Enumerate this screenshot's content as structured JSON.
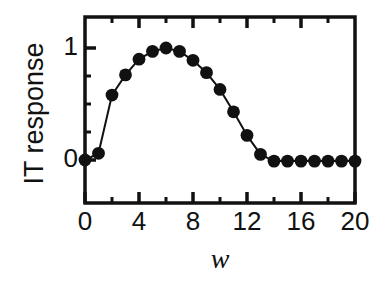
{
  "chart_data": {
    "type": "line",
    "title": "",
    "xlabel": "w",
    "ylabel": "IT response",
    "xlim": [
      0,
      20
    ],
    "ylim": [
      -0.12,
      1.18
    ],
    "grid": false,
    "legend": null,
    "marker": "filled-circle",
    "marker_color": "#111111",
    "line_color": "#111111",
    "x_major_ticks": [
      0,
      4,
      8,
      12,
      16,
      20
    ],
    "x_minor_ticks": [
      2,
      6,
      10,
      14,
      18
    ],
    "x_tick_labels": [
      "0",
      "4",
      "8",
      "12",
      "16",
      "20"
    ],
    "y_major_ticks": [
      0,
      1
    ],
    "y_minor_ticks": [
      0.25,
      0.5,
      0.75
    ],
    "y_tick_labels": [
      "0",
      "1"
    ],
    "x": [
      0,
      1,
      2,
      3,
      4,
      5,
      6,
      7,
      8,
      9,
      10,
      11,
      12,
      13,
      14,
      15,
      16,
      17,
      18,
      19,
      20
    ],
    "values": [
      0.0,
      0.06,
      0.58,
      0.76,
      0.9,
      0.97,
      1.0,
      0.97,
      0.89,
      0.78,
      0.63,
      0.43,
      0.22,
      0.05,
      -0.01,
      -0.01,
      -0.01,
      -0.01,
      -0.01,
      -0.01,
      -0.01
    ]
  },
  "axes": {
    "y_label_text": "IT response",
    "x_label_text": "w"
  }
}
